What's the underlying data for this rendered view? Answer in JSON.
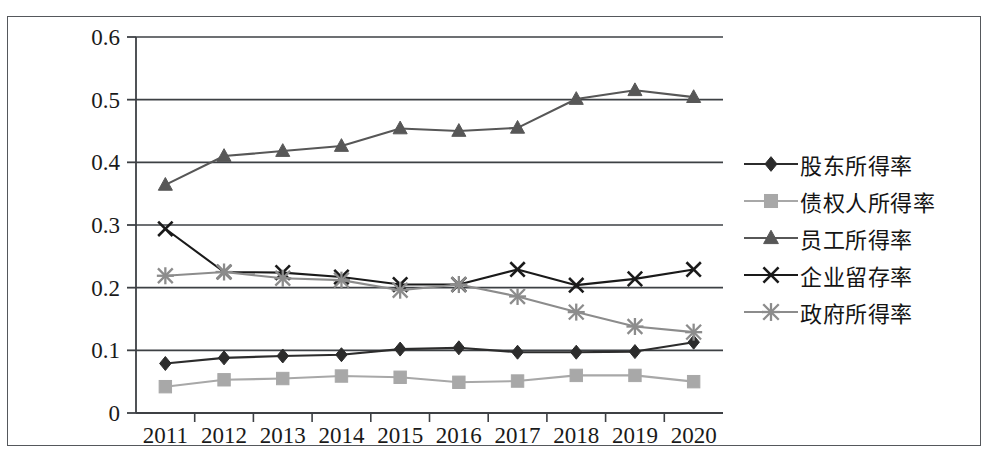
{
  "chart_data": {
    "type": "line",
    "title": "",
    "subtitle": "",
    "xlabel": "",
    "ylabel": "",
    "categories": [
      "2011",
      "2012",
      "2013",
      "2014",
      "2015",
      "2016",
      "2017",
      "2018",
      "2019",
      "2020"
    ],
    "xlim": [
      "2011",
      "2020"
    ],
    "ylim": [
      0,
      0.6
    ],
    "ytick_labels": [
      "0",
      "0.1",
      "0.2",
      "0.3",
      "0.4",
      "0.5",
      "0.6"
    ],
    "ytick_values": [
      0,
      0.1,
      0.2,
      0.3,
      0.4,
      0.5,
      0.6
    ],
    "grid": "horizontal",
    "legend_position": "right",
    "series": [
      {
        "name": "股东所得率",
        "marker": "diamond",
        "color": "#2c2c2c",
        "values": [
          0.079,
          0.088,
          0.091,
          0.093,
          0.102,
          0.104,
          0.097,
          0.097,
          0.098,
          0.113
        ]
      },
      {
        "name": "债权人所得率",
        "marker": "square",
        "color": "#a8a8a8",
        "values": [
          0.042,
          0.053,
          0.055,
          0.059,
          0.057,
          0.049,
          0.051,
          0.06,
          0.06,
          0.05
        ]
      },
      {
        "name": "员工所得率",
        "marker": "triangle",
        "color": "#575757",
        "values": [
          0.364,
          0.41,
          0.418,
          0.426,
          0.454,
          0.45,
          0.455,
          0.501,
          0.515,
          0.504
        ]
      },
      {
        "name": "企业留存率",
        "marker": "x",
        "color": "#1a1a1a",
        "values": [
          0.294,
          0.225,
          0.224,
          0.217,
          0.205,
          0.205,
          0.229,
          0.204,
          0.214,
          0.229
        ]
      },
      {
        "name": "政府所得率",
        "marker": "asterisk",
        "color": "#8c8c8c",
        "values": [
          0.219,
          0.225,
          0.215,
          0.212,
          0.196,
          0.205,
          0.186,
          0.161,
          0.138,
          0.129
        ]
      }
    ]
  },
  "legend": {
    "items": [
      {
        "label": "股东所得率"
      },
      {
        "label": "债权人所得率"
      },
      {
        "label": "员工所得率"
      },
      {
        "label": "企业留存率"
      },
      {
        "label": "政府所得率"
      }
    ]
  }
}
